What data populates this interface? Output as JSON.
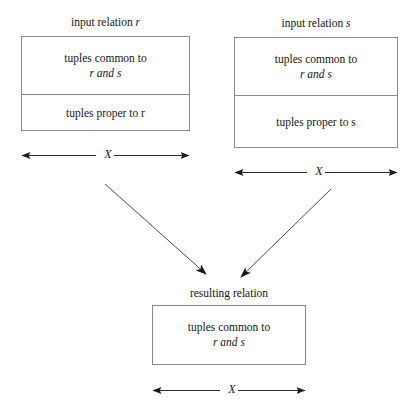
{
  "diagram": {
    "line_color": "#8a8a8a",
    "arrow_color": "#2b2b2b",
    "text_color": "#151515",
    "background": "#ffffff"
  },
  "input_r": {
    "caption": "input relation r",
    "caption_plain": "input relation",
    "caption_var": "r",
    "upper_cell_line1": "tuples common to",
    "upper_cell_line2": "r and s",
    "lower_cell": "tuples proper to r",
    "dimension_label": "X"
  },
  "input_s": {
    "caption": "input relation s",
    "caption_plain": "input relation",
    "caption_var": "s",
    "upper_cell_line1": "tuples common to",
    "upper_cell_line2": "r and s",
    "lower_cell": "tuples proper to s",
    "dimension_label": "X"
  },
  "result": {
    "caption": "resulting relation",
    "cell_line1": "tuples common to",
    "cell_line2": "r and s",
    "dimension_label": "X"
  },
  "arrows": {
    "left_arrow_name": "arrow-from-r-to-result",
    "right_arrow_name": "arrow-from-s-to-result"
  }
}
